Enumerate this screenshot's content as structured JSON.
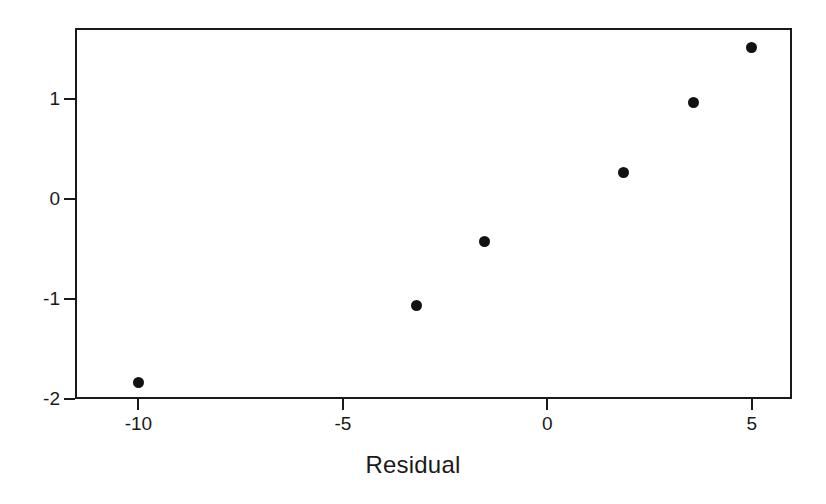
{
  "chart_data": {
    "type": "scatter",
    "title": "",
    "xlabel": "Residual",
    "ylabel": "",
    "xlim": [
      -11.55,
      5.98
    ],
    "ylim": [
      -2.0,
      1.71
    ],
    "grid": false,
    "legend": "none",
    "marker": {
      "shape": "circle",
      "color": "#121212",
      "size_px": 11
    },
    "xticks": [
      {
        "value": -10,
        "label": "-10"
      },
      {
        "value": -5,
        "label": "-5"
      },
      {
        "value": 0,
        "label": "0"
      },
      {
        "value": 5,
        "label": "5"
      }
    ],
    "yticks": [
      {
        "value": 1,
        "label": "1"
      },
      {
        "value": 0,
        "label": "0"
      },
      {
        "value": -1,
        "label": "-1"
      },
      {
        "value": -2,
        "label": "-2"
      }
    ],
    "x": [
      -10.0,
      -3.21,
      -1.55,
      1.87,
      3.58,
      5.0
    ],
    "y": [
      -1.83,
      -1.06,
      -0.42,
      0.27,
      0.97,
      1.52
    ],
    "points": [
      {
        "x": -10.0,
        "y": -1.83
      },
      {
        "x": -3.21,
        "y": -1.06
      },
      {
        "x": -1.55,
        "y": -0.42
      },
      {
        "x": 1.87,
        "y": 0.27
      },
      {
        "x": 3.58,
        "y": 0.97
      },
      {
        "x": 5.0,
        "y": 1.52
      }
    ]
  },
  "axis_title": {
    "x": "Residual"
  },
  "colors": {
    "frame": "#1a1a1a",
    "marker": "#121212",
    "background": "#ffffff"
  }
}
